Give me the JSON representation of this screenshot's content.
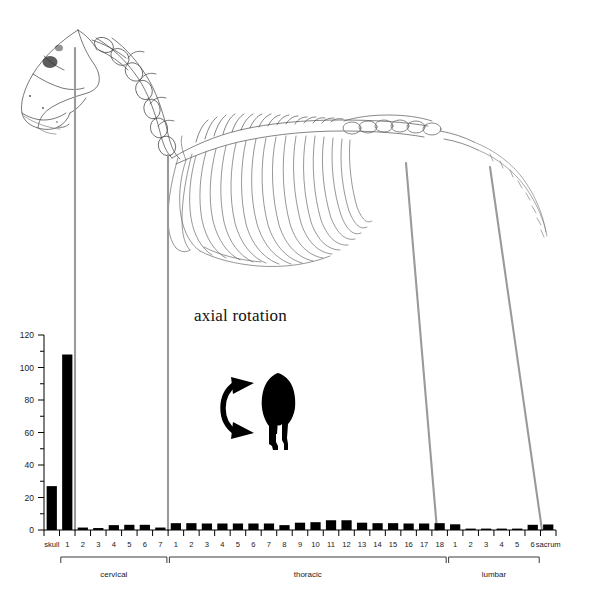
{
  "figure": {
    "annotation_title": "axial rotation",
    "icons": {
      "rotation_arrow": "curved-double-arrow-icon",
      "animal": "horse-rear-silhouette-icon",
      "skeleton": "horse-skeleton-illustration"
    },
    "colors": {
      "bar": "#000000",
      "leader_line": "#9a9a9a",
      "axis": "#000000",
      "text": "#1a1a1a"
    }
  },
  "chart_data": {
    "type": "bar",
    "title": "axial rotation",
    "xlabel": "",
    "ylabel": "",
    "ylim": [
      0,
      120
    ],
    "grid": false,
    "legend": false,
    "y_major_ticks": [
      0,
      20,
      40,
      60,
      80,
      100,
      120
    ],
    "y_minor_ticks": [
      10,
      30,
      50,
      70,
      90,
      110
    ],
    "y_tick_labels": [
      "0",
      "20",
      "40",
      "60",
      "80",
      "100",
      "120"
    ],
    "categories": [
      "skull",
      "1",
      "2",
      "3",
      "4",
      "5",
      "6",
      "7",
      "1",
      "2",
      "3",
      "4",
      "5",
      "6",
      "7",
      "8",
      "9",
      "10",
      "11",
      "12",
      "13",
      "14",
      "15",
      "16",
      "17",
      "18",
      "1",
      "2",
      "3",
      "4",
      "5",
      "6",
      "sacrum"
    ],
    "values": [
      27,
      108,
      1.5,
      1.2,
      3,
      3.2,
      3.2,
      1.5,
      4.2,
      4.2,
      4,
      4,
      4,
      4,
      4,
      3,
      4.5,
      4.8,
      6,
      6,
      4.5,
      4.2,
      4.2,
      4,
      4,
      4.2,
      3.5,
      0.8,
      0.6,
      0.6,
      0.8,
      3.2,
      3.4
    ],
    "groups": [
      {
        "label": "cervical",
        "start_index": 1,
        "end_index": 7
      },
      {
        "label": "thoracic",
        "start_index": 8,
        "end_index": 25
      },
      {
        "label": "lumbar",
        "start_index": 26,
        "end_index": 31
      }
    ]
  }
}
